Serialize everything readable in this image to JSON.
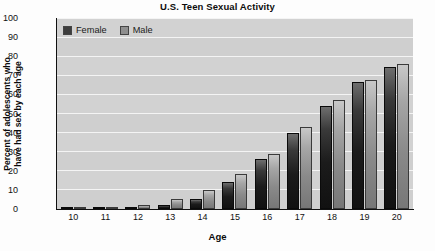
{
  "chart_data": {
    "type": "bar",
    "title": "U.S. Teen Sexual Activity",
    "xlabel": "Age",
    "ylabel": "Percent of adolescents who have had sex by each age",
    "ylabel_lines": [
      "Percent of adolescents who",
      "have had sex by each age"
    ],
    "categories": [
      "10",
      "11",
      "12",
      "13",
      "14",
      "15",
      "16",
      "17",
      "18",
      "19",
      "20"
    ],
    "series": [
      {
        "name": "Female",
        "color": "#2b2b2b",
        "values": [
          0.3,
          0.5,
          0.8,
          2,
          5,
          14,
          26,
          40,
          54,
          66.5,
          74.5
        ]
      },
      {
        "name": "Male",
        "color": "#8f8f8f",
        "values": [
          0.8,
          1.2,
          2,
          5,
          10,
          18.5,
          29,
          43,
          57,
          67.5,
          76
        ]
      }
    ],
    "ylim": [
      0,
      100
    ],
    "ytick_values": [
      "0",
      "10",
      "20",
      "30",
      "40",
      "50",
      "60",
      "70",
      "80",
      "90",
      "100"
    ],
    "ytick_step": 10,
    "grid": true,
    "grid_axis": "y",
    "legend_position": "top-left-inside",
    "plot_background": "#d2d2d2",
    "gridline_color": "#f4f4f4"
  }
}
